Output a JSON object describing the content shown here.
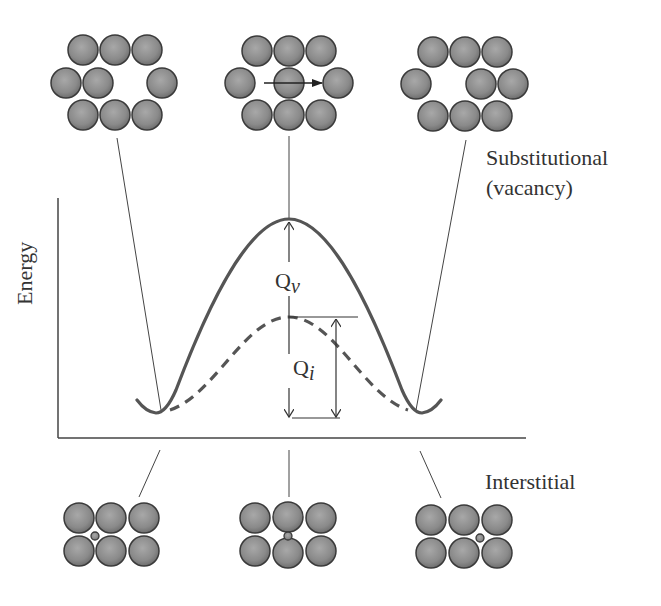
{
  "figure": {
    "type": "diffusion-activation-energy-diagram",
    "y_axis_label": "Energy",
    "labels": {
      "substitutional_line1": "Substitutional",
      "substitutional_line2": "(vacancy)",
      "interstitial": "Interstitial",
      "qv_main": "Q",
      "qv_sub": "v",
      "qi_main": "Q",
      "qi_sub": "i"
    },
    "curves": [
      {
        "name": "substitutional-vacancy",
        "style": "solid",
        "description": "higher energy barrier Qv"
      },
      {
        "name": "interstitial",
        "style": "dashed",
        "description": "lower energy barrier Qi"
      }
    ],
    "top_row_states": [
      {
        "name": "initial",
        "description": "atom adjacent to vacancy on right"
      },
      {
        "name": "transition",
        "description": "atom moving right into vacancy (arrow)"
      },
      {
        "name": "final",
        "description": "vacancy moved to left"
      }
    ],
    "bottom_row_states": [
      {
        "name": "initial",
        "description": "small interstitial atom in left gap"
      },
      {
        "name": "transition",
        "description": "interstitial squeezing between atoms"
      },
      {
        "name": "final",
        "description": "interstitial atom in right gap"
      }
    ],
    "colors": {
      "atom_fill": "#8c8c8c",
      "atom_stroke": "#3a3a3a",
      "curve": "#555555",
      "line": "#444444"
    }
  }
}
